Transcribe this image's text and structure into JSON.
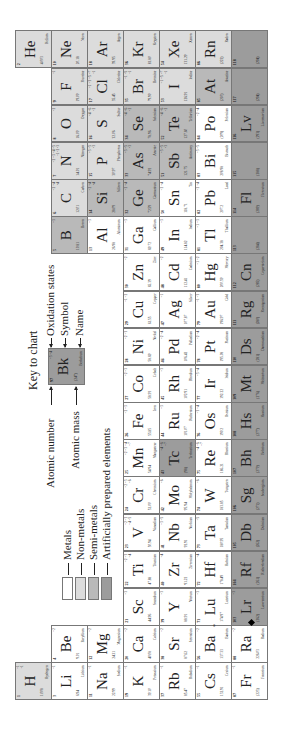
{
  "key": {
    "title": "Key to chart",
    "sample": {
      "z": "97",
      "ox": "+3 +4",
      "sym": "Bk",
      "mass": "(247)",
      "name": "Berkelium",
      "category": "artificial"
    },
    "labels": {
      "oxidation": "Oxidation states",
      "symbol": "Symbol",
      "name": "Name",
      "atomic_number": "Atomic number",
      "atomic_mass": "Atomic mass"
    }
  },
  "legend": [
    {
      "label": "Metals",
      "color": "#ffffff"
    },
    {
      "label": "Non-metals",
      "color": "#dcdcdc"
    },
    {
      "label": "Semi-metals",
      "color": "#b9b9b9"
    },
    {
      "label": "Artificially prepared elements",
      "color": "#9c9c9c"
    }
  ],
  "elements": [
    {
      "z": "1",
      "sym": "H",
      "name": "Hydrogen",
      "mass": "1.008",
      "ox": "+1\n-1",
      "g": 1,
      "p": 1,
      "cat": "nonmetal"
    },
    {
      "z": "2",
      "sym": "He",
      "name": "Helium",
      "mass": "4.003",
      "ox": "",
      "g": 18,
      "p": 1,
      "cat": "nonmetal"
    },
    {
      "z": "3",
      "sym": "Li",
      "name": "Lithium",
      "mass": "6.94",
      "ox": "+1",
      "g": 1,
      "p": 2,
      "cat": "metal"
    },
    {
      "z": "4",
      "sym": "Be",
      "name": "Beryllium",
      "mass": "9.01",
      "ox": "+2",
      "g": 2,
      "p": 2,
      "cat": "metal"
    },
    {
      "z": "5",
      "sym": "B",
      "name": "Boron",
      "mass": "10.81",
      "ox": "+3",
      "g": 13,
      "p": 2,
      "cat": "semimetal"
    },
    {
      "z": "6",
      "sym": "C",
      "name": "Carbon",
      "mass": "12.01",
      "ox": "+2 +4\n-4",
      "g": 14,
      "p": 2,
      "cat": "nonmetal"
    },
    {
      "z": "7",
      "sym": "N",
      "name": "Nitrogen",
      "mass": "14.01",
      "ox": "+2 +3 +4 +5\n-1 -2 -3",
      "g": 15,
      "p": 2,
      "cat": "nonmetal"
    },
    {
      "z": "8",
      "sym": "O",
      "name": "Oxygen",
      "mass": "16.00",
      "ox": "-2",
      "g": 16,
      "p": 2,
      "cat": "nonmetal"
    },
    {
      "z": "9",
      "sym": "F",
      "name": "Fluorine",
      "mass": "19.00",
      "ox": "-1",
      "g": 17,
      "p": 2,
      "cat": "nonmetal"
    },
    {
      "z": "10",
      "sym": "Ne",
      "name": "Neon",
      "mass": "20.18",
      "ox": "",
      "g": 18,
      "p": 2,
      "cat": "nonmetal"
    },
    {
      "z": "11",
      "sym": "Na",
      "name": "Sodium",
      "mass": "22.99",
      "ox": "+1",
      "g": 1,
      "p": 3,
      "cat": "metal"
    },
    {
      "z": "12",
      "sym": "Mg",
      "name": "Magnesium",
      "mass": "24.31",
      "ox": "+2",
      "g": 2,
      "p": 3,
      "cat": "metal"
    },
    {
      "z": "13",
      "sym": "Al",
      "name": "Aluminum",
      "mass": "26.98",
      "ox": "+3",
      "g": 13,
      "p": 3,
      "cat": "metal"
    },
    {
      "z": "14",
      "sym": "Si",
      "name": "Silicon",
      "mass": "28.09",
      "ox": "+2 +4\n-4",
      "g": 14,
      "p": 3,
      "cat": "semimetal"
    },
    {
      "z": "15",
      "sym": "P",
      "name": "Phosphorus",
      "mass": "30.97",
      "ox": "+3 +5\n-3",
      "g": 15,
      "p": 3,
      "cat": "nonmetal"
    },
    {
      "z": "16",
      "sym": "S",
      "name": "Sulfur",
      "mass": "32.06",
      "ox": "+4 +6\n-2",
      "g": 16,
      "p": 3,
      "cat": "nonmetal"
    },
    {
      "z": "17",
      "sym": "Cl",
      "name": "Chlorine",
      "mass": "35.45",
      "ox": "+1 +3 +5 +7\n-1",
      "g": 17,
      "p": 3,
      "cat": "nonmetal"
    },
    {
      "z": "18",
      "sym": "Ar",
      "name": "Argon",
      "mass": "39.95",
      "ox": "",
      "g": 18,
      "p": 3,
      "cat": "nonmetal"
    },
    {
      "z": "19",
      "sym": "K",
      "name": "Potassium",
      "mass": "39.10",
      "ox": "+1",
      "g": 1,
      "p": 4,
      "cat": "metal"
    },
    {
      "z": "20",
      "sym": "Ca",
      "name": "Calcium",
      "mass": "40.08",
      "ox": "+2",
      "g": 2,
      "p": 4,
      "cat": "metal"
    },
    {
      "z": "21",
      "sym": "Sc",
      "name": "Scandium",
      "mass": "44.96",
      "ox": "+3",
      "g": 3,
      "p": 4,
      "cat": "metal"
    },
    {
      "z": "22",
      "sym": "Ti",
      "name": "Titanium",
      "mass": "47.88",
      "ox": "+2 +3\n+4",
      "g": 4,
      "p": 4,
      "cat": "metal"
    },
    {
      "z": "23",
      "sym": "V",
      "name": "Vanadium",
      "mass": "50.94",
      "ox": "+2 +3\n+4 +5",
      "g": 5,
      "p": 4,
      "cat": "metal"
    },
    {
      "z": "24",
      "sym": "Cr",
      "name": "Chromium",
      "mass": "52.00",
      "ox": "+2 +3\n+6",
      "g": 6,
      "p": 4,
      "cat": "metal"
    },
    {
      "z": "25",
      "sym": "Mn",
      "name": "Manganese",
      "mass": "54.94",
      "ox": "+2 +3 +4\n+7",
      "g": 7,
      "p": 4,
      "cat": "metal"
    },
    {
      "z": "26",
      "sym": "Fe",
      "name": "Iron",
      "mass": "55.85",
      "ox": "+2 +3",
      "g": 8,
      "p": 4,
      "cat": "metal"
    },
    {
      "z": "27",
      "sym": "Co",
      "name": "Cobalt",
      "mass": "58.93",
      "ox": "+2 +3",
      "g": 9,
      "p": 4,
      "cat": "metal"
    },
    {
      "z": "28",
      "sym": "Ni",
      "name": "Nickel",
      "mass": "58.69",
      "ox": "+2 +3",
      "g": 10,
      "p": 4,
      "cat": "metal"
    },
    {
      "z": "29",
      "sym": "Cu",
      "name": "Copper",
      "mass": "63.55",
      "ox": "+1 +2",
      "g": 11,
      "p": 4,
      "cat": "metal"
    },
    {
      "z": "30",
      "sym": "Zn",
      "name": "Zinc",
      "mass": "65.39",
      "ox": "+2",
      "g": 12,
      "p": 4,
      "cat": "metal"
    },
    {
      "z": "31",
      "sym": "Ga",
      "name": "Gallium",
      "mass": "69.72",
      "ox": "+3",
      "g": 13,
      "p": 4,
      "cat": "metal"
    },
    {
      "z": "32",
      "sym": "Ge",
      "name": "Germanium",
      "mass": "72.59",
      "ox": "+2 +4",
      "g": 14,
      "p": 4,
      "cat": "semimetal"
    },
    {
      "z": "33",
      "sym": "As",
      "name": "Arsenic",
      "mass": "74.92",
      "ox": "+3 +5\n-3",
      "g": 15,
      "p": 4,
      "cat": "semimetal"
    },
    {
      "z": "34",
      "sym": "Se",
      "name": "Selenium",
      "mass": "78.96",
      "ox": "+4 +6\n-2",
      "g": 16,
      "p": 4,
      "cat": "semimetal"
    },
    {
      "z": "35",
      "sym": "Br",
      "name": "Bromine",
      "mass": "79.90",
      "ox": "+1 +5\n-1",
      "g": 17,
      "p": 4,
      "cat": "nonmetal"
    },
    {
      "z": "36",
      "sym": "Kr",
      "name": "Krypton",
      "mass": "83.80",
      "ox": "",
      "g": 18,
      "p": 4,
      "cat": "nonmetal"
    },
    {
      "z": "37",
      "sym": "Rb",
      "name": "Rubidium",
      "mass": "85.47",
      "ox": "+1",
      "g": 1,
      "p": 5,
      "cat": "metal"
    },
    {
      "z": "38",
      "sym": "Sr",
      "name": "Strontium",
      "mass": "87.62",
      "ox": "+2",
      "g": 2,
      "p": 5,
      "cat": "metal"
    },
    {
      "z": "39",
      "sym": "Y",
      "name": "Yttrium",
      "mass": "88.91",
      "ox": "+3",
      "g": 3,
      "p": 5,
      "cat": "metal"
    },
    {
      "z": "40",
      "sym": "Zr",
      "name": "Zirconium",
      "mass": "91.22",
      "ox": "+4",
      "g": 4,
      "p": 5,
      "cat": "metal"
    },
    {
      "z": "41",
      "sym": "Nb",
      "name": "Niobium",
      "mass": "92.91",
      "ox": "+3 +5",
      "g": 5,
      "p": 5,
      "cat": "metal"
    },
    {
      "z": "42",
      "sym": "Mo",
      "name": "Molybdenum",
      "mass": "95.94",
      "ox": "+6",
      "g": 6,
      "p": 5,
      "cat": "metal"
    },
    {
      "z": "43",
      "sym": "Tc",
      "name": "Technetium",
      "mass": "(98)",
      "ox": "+4 +6\n+7",
      "g": 7,
      "p": 5,
      "cat": "artificial"
    },
    {
      "z": "44",
      "sym": "Ru",
      "name": "Ruthenium",
      "mass": "101.07",
      "ox": "+3",
      "g": 8,
      "p": 5,
      "cat": "metal"
    },
    {
      "z": "45",
      "sym": "Rh",
      "name": "Rhodium",
      "mass": "102.91",
      "ox": "+3",
      "g": 9,
      "p": 5,
      "cat": "metal"
    },
    {
      "z": "46",
      "sym": "Pd",
      "name": "Palladium",
      "mass": "106.42",
      "ox": "+2 +4",
      "g": 10,
      "p": 5,
      "cat": "metal"
    },
    {
      "z": "47",
      "sym": "Ag",
      "name": "Silver",
      "mass": "107.87",
      "ox": "+1",
      "g": 11,
      "p": 5,
      "cat": "metal"
    },
    {
      "z": "48",
      "sym": "Cd",
      "name": "Cadmium",
      "mass": "112.41",
      "ox": "+2",
      "g": 12,
      "p": 5,
      "cat": "metal"
    },
    {
      "z": "49",
      "sym": "In",
      "name": "Indium",
      "mass": "114.82",
      "ox": "+3",
      "g": 13,
      "p": 5,
      "cat": "metal"
    },
    {
      "z": "50",
      "sym": "Sn",
      "name": "Tin",
      "mass": "118.71",
      "ox": "+2 +4",
      "g": 14,
      "p": 5,
      "cat": "metal"
    },
    {
      "z": "51",
      "sym": "Sb",
      "name": "Antimony",
      "mass": "121.75",
      "ox": "+3 +5\n-3",
      "g": 15,
      "p": 5,
      "cat": "semimetal"
    },
    {
      "z": "52",
      "sym": "Te",
      "name": "Tellurium",
      "mass": "127.60",
      "ox": "+4 +6\n-2",
      "g": 16,
      "p": 5,
      "cat": "semimetal"
    },
    {
      "z": "53",
      "sym": "I",
      "name": "Iodine",
      "mass": "126.91",
      "ox": "+1 +5 +7\n-1",
      "g": 17,
      "p": 5,
      "cat": "nonmetal"
    },
    {
      "z": "54",
      "sym": "Xe",
      "name": "Xenon",
      "mass": "131.29",
      "ox": "",
      "g": 18,
      "p": 5,
      "cat": "nonmetal"
    },
    {
      "z": "55",
      "sym": "Cs",
      "name": "Cesium",
      "mass": "132.91",
      "ox": "+1",
      "g": 1,
      "p": 6,
      "cat": "metal"
    },
    {
      "z": "56",
      "sym": "Ba",
      "name": "Barium",
      "mass": "137.33",
      "ox": "+2",
      "g": 2,
      "p": 6,
      "cat": "metal"
    },
    {
      "z": "71",
      "sym": "Lu",
      "name": "Lutetium",
      "mass": "174.97",
      "ox": "+3",
      "g": 3,
      "p": 6,
      "cat": "metal"
    },
    {
      "z": "72",
      "sym": "Hf",
      "name": "Hafnium",
      "mass": "178.49",
      "ox": "+4",
      "g": 4,
      "p": 6,
      "cat": "metal"
    },
    {
      "z": "73",
      "sym": "Ta",
      "name": "Tantalum",
      "mass": "180.95",
      "ox": "+5",
      "g": 5,
      "p": 6,
      "cat": "metal"
    },
    {
      "z": "74",
      "sym": "W",
      "name": "Tungsten",
      "mass": "183.85",
      "ox": "+6",
      "g": 6,
      "p": 6,
      "cat": "metal"
    },
    {
      "z": "75",
      "sym": "Re",
      "name": "Rhenium",
      "mass": "186.21",
      "ox": "+4 +6\n+7",
      "g": 7,
      "p": 6,
      "cat": "metal"
    },
    {
      "z": "76",
      "sym": "Os",
      "name": "Osmium",
      "mass": "190.2",
      "ox": "+3 +4",
      "g": 8,
      "p": 6,
      "cat": "metal"
    },
    {
      "z": "77",
      "sym": "Ir",
      "name": "Iridium",
      "mass": "192.22",
      "ox": "+3 +4",
      "g": 9,
      "p": 6,
      "cat": "metal"
    },
    {
      "z": "78",
      "sym": "Pt",
      "name": "Platinum",
      "mass": "195.08",
      "ox": "+2 +4",
      "g": 10,
      "p": 6,
      "cat": "metal"
    },
    {
      "z": "79",
      "sym": "Au",
      "name": "Gold",
      "mass": "196.97",
      "ox": "+1 +3",
      "g": 11,
      "p": 6,
      "cat": "metal"
    },
    {
      "z": "80",
      "sym": "Hg",
      "name": "Mercury",
      "mass": "200.59",
      "ox": "+1 +2",
      "g": 12,
      "p": 6,
      "cat": "metal"
    },
    {
      "z": "81",
      "sym": "Tl",
      "name": "Thallium",
      "mass": "204.38",
      "ox": "+1 +3",
      "g": 13,
      "p": 6,
      "cat": "metal"
    },
    {
      "z": "82",
      "sym": "Pb",
      "name": "Lead",
      "mass": "207.2",
      "ox": "+2 +4",
      "g": 14,
      "p": 6,
      "cat": "metal"
    },
    {
      "z": "83",
      "sym": "Bi",
      "name": "Bismuth",
      "mass": "208.98",
      "ox": "+3 +5",
      "g": 15,
      "p": 6,
      "cat": "metal"
    },
    {
      "z": "84",
      "sym": "Po",
      "name": "Polonium",
      "mass": "(209)",
      "ox": "+2 +4",
      "g": 16,
      "p": 6,
      "cat": "metal"
    },
    {
      "z": "85",
      "sym": "At",
      "name": "Astatine",
      "mass": "(210)",
      "ox": "",
      "g": 17,
      "p": 6,
      "cat": "semimetal"
    },
    {
      "z": "86",
      "sym": "Rn",
      "name": "Radon",
      "mass": "(222)",
      "ox": "",
      "g": 18,
      "p": 6,
      "cat": "nonmetal"
    },
    {
      "z": "87",
      "sym": "Fr",
      "name": "Francium",
      "mass": "(223)",
      "ox": "+1",
      "g": 1,
      "p": 7,
      "cat": "metal"
    },
    {
      "z": "88",
      "sym": "Ra",
      "name": "Radium",
      "mass": "226.03",
      "ox": "+2",
      "g": 2,
      "p": 7,
      "cat": "metal"
    },
    {
      "z": "103",
      "sym": "Lr",
      "name": "Lawrencium",
      "mass": "(262)",
      "ox": "+3",
      "g": 3,
      "p": 7,
      "cat": "artificial"
    },
    {
      "z": "104",
      "sym": "Rf",
      "name": "Rutherfordium",
      "mass": "(261)",
      "ox": "",
      "g": 4,
      "p": 7,
      "cat": "artificial"
    },
    {
      "z": "105",
      "sym": "Db",
      "name": "Dubnium",
      "mass": "(262)",
      "ox": "",
      "g": 5,
      "p": 7,
      "cat": "artificial"
    },
    {
      "z": "106",
      "sym": "Sg",
      "name": "Seaborgium",
      "mass": "(271)",
      "ox": "",
      "g": 6,
      "p": 7,
      "cat": "artificial"
    },
    {
      "z": "107",
      "sym": "Bh",
      "name": "Bohrium",
      "mass": "(270)",
      "ox": "",
      "g": 7,
      "p": 7,
      "cat": "artificial"
    },
    {
      "z": "108",
      "sym": "Hs",
      "name": "Hassium",
      "mass": "(277)",
      "ox": "",
      "g": 8,
      "p": 7,
      "cat": "artificial"
    },
    {
      "z": "109",
      "sym": "Mt",
      "name": "Meitnerium",
      "mass": "(276)",
      "ox": "",
      "g": 9,
      "p": 7,
      "cat": "artificial"
    },
    {
      "z": "110",
      "sym": "Ds",
      "name": "Darmstadtium",
      "mass": "(281)",
      "ox": "",
      "g": 10,
      "p": 7,
      "cat": "artificial"
    },
    {
      "z": "111",
      "sym": "Rg",
      "name": "Roentgenium",
      "mass": "(280)",
      "ox": "",
      "g": 11,
      "p": 7,
      "cat": "artificial"
    },
    {
      "z": "112",
      "sym": "Cn",
      "name": "Copernicium",
      "mass": "(285)",
      "ox": "",
      "g": 12,
      "p": 7,
      "cat": "artificial"
    },
    {
      "z": "113",
      "sym": "",
      "name": "",
      "mass": "(284)",
      "ox": "",
      "g": 13,
      "p": 7,
      "cat": "artificial"
    },
    {
      "z": "114",
      "sym": "Fl",
      "name": "Flerovium",
      "mass": "(289)",
      "ox": "",
      "g": 14,
      "p": 7,
      "cat": "artificial"
    },
    {
      "z": "115",
      "sym": "",
      "name": "",
      "mass": "(288)",
      "ox": "",
      "g": 15,
      "p": 7,
      "cat": "artificial"
    },
    {
      "z": "116",
      "sym": "Lv",
      "name": "Livermorium",
      "mass": "(293)",
      "ox": "",
      "g": 16,
      "p": 7,
      "cat": "artificial"
    },
    {
      "z": "117",
      "sym": "",
      "name": "",
      "mass": "(294)",
      "ox": "",
      "g": 17,
      "p": 7,
      "cat": "artificial"
    },
    {
      "z": "118",
      "sym": "",
      "name": "",
      "mass": "(294)",
      "ox": "",
      "g": 18,
      "p": 7,
      "cat": "artificial"
    }
  ],
  "markers": {
    "lanthanide": "*",
    "actinide": "◆"
  }
}
